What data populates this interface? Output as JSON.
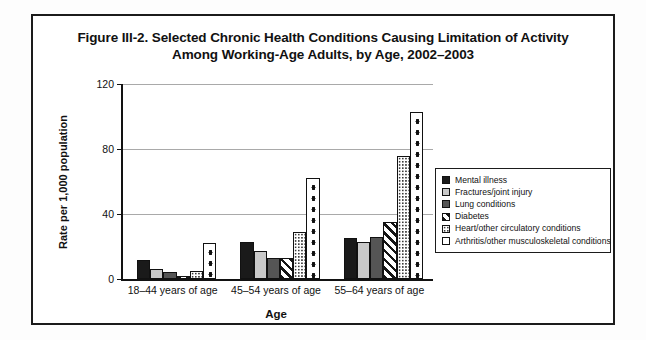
{
  "figure": {
    "title_line1": "Figure III-2. Selected Chronic Health Conditions Causing Limitation of Activity",
    "title_line2": "Among Working-Age Adults, by Age, 2002–2003"
  },
  "chart_data": {
    "type": "bar",
    "title": "Figure III-2. Selected Chronic Health Conditions Causing Limitation of Activity Among Working-Age Adults, by Age, 2002–2003",
    "xlabel": "Age",
    "ylabel": "Rate per 1,000 population",
    "categories": [
      "18–44 years of age",
      "45–54 years of age",
      "55–64 years of age"
    ],
    "ylim": [
      0,
      120
    ],
    "yticks": [
      0,
      40,
      80,
      120
    ],
    "ytick_labels": [
      "0",
      "40",
      "80",
      "120"
    ],
    "grid": "horizontal",
    "legend_position": "right",
    "series": [
      {
        "name": "Mental illness",
        "pattern": "solid-black",
        "color": "#1a1a1a",
        "values": [
          12,
          23,
          25
        ]
      },
      {
        "name": "Fractures/joint injury",
        "pattern": "light-gray",
        "color": "#c9c9c9",
        "values": [
          6,
          17,
          23
        ]
      },
      {
        "name": "Lung conditions",
        "pattern": "dark-gray",
        "color": "#555555",
        "values": [
          4.5,
          13,
          26
        ]
      },
      {
        "name": "Diabetes",
        "pattern": "diagonal-hatch",
        "color": "#ffffff",
        "values": [
          2,
          13,
          35
        ]
      },
      {
        "name": "Heart/other circulatory conditions",
        "pattern": "fine-dots",
        "color": "#ffffff",
        "values": [
          5,
          29,
          76
        ]
      },
      {
        "name": "Arthritis/other musculoskeletal conditions",
        "pattern": "large-dots",
        "color": "#ffffff",
        "values": [
          22,
          62,
          103
        ]
      }
    ]
  }
}
